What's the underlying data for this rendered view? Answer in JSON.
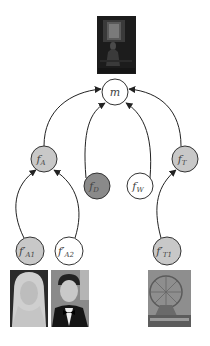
{
  "diagram": {
    "type": "graphical-model",
    "colors": {
      "edge": "#222222",
      "node_stroke": "#333333",
      "shaded_fill": "#c8c8c8",
      "dark_fill": "#8a8a8a",
      "white_fill": "#ffffff"
    },
    "root": {
      "id": "m",
      "label": "m",
      "image": "dark-painting-woman-by-window"
    },
    "nodes": [
      {
        "id": "fA",
        "label": "f",
        "sub": "A",
        "fill": "shaded"
      },
      {
        "id": "fD",
        "label": "f",
        "sub": "D",
        "fill": "dark"
      },
      {
        "id": "fW",
        "label": "f",
        "sub": "W",
        "fill": "white"
      },
      {
        "id": "fT",
        "label": "f",
        "sub": "T",
        "fill": "shaded"
      },
      {
        "id": "fA1p",
        "label": "f′",
        "sub": "A1",
        "fill": "shaded"
      },
      {
        "id": "fA2p",
        "label": "f′",
        "sub": "A2",
        "fill": "white"
      },
      {
        "id": "fT1p",
        "label": "f′",
        "sub": "T1",
        "fill": "shaded"
      }
    ],
    "edges": [
      {
        "from": "fA",
        "to": "m"
      },
      {
        "from": "fD",
        "to": "m"
      },
      {
        "from": "fW",
        "to": "m"
      },
      {
        "from": "fT",
        "to": "m"
      },
      {
        "from": "fA1p",
        "to": "fA"
      },
      {
        "from": "fA2p",
        "to": "fA"
      },
      {
        "from": "fT1p",
        "to": "fT"
      }
    ],
    "leaf_images": [
      {
        "node": "fA1p",
        "image": "portrait-blonde-woman"
      },
      {
        "node": "fA2p",
        "image": "portrait-man-in-tuxedo"
      },
      {
        "node": "fT1p",
        "image": "ferris-wheel-fairground"
      }
    ]
  }
}
